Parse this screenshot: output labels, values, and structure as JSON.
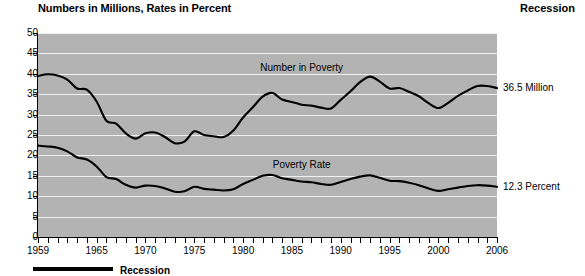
{
  "header": {
    "title": "Numbers in Millions, Rates in Percent",
    "recession_legend_label": "Recession"
  },
  "caption": {
    "text": "Recession"
  },
  "chart_data": {
    "type": "line",
    "title": "Numbers in Millions, Rates in Percent",
    "xlabel": "",
    "ylabel": "",
    "xlim": [
      1959,
      2006
    ],
    "ylim": [
      0,
      50
    ],
    "grid": true,
    "legend_position": "inline-annotation",
    "plot_background_color": "#b3b3b3",
    "gridline_color": "#f0f0f0",
    "line_color": "#000000",
    "y_ticks": [
      0,
      5,
      10,
      15,
      20,
      25,
      30,
      35,
      40,
      45,
      50
    ],
    "x_tick_labels": [
      "1959",
      "1965",
      "1970",
      "1975",
      "1980",
      "1985",
      "1990",
      "1995",
      "2000",
      "2006"
    ],
    "x_tick_label_years": [
      1959,
      1965,
      1970,
      1975,
      1980,
      1985,
      1990,
      1995,
      2000,
      2006
    ],
    "x": [
      1959,
      1960,
      1961,
      1962,
      1963,
      1964,
      1965,
      1966,
      1967,
      1968,
      1969,
      1970,
      1971,
      1972,
      1973,
      1974,
      1975,
      1976,
      1977,
      1978,
      1979,
      1980,
      1981,
      1982,
      1983,
      1984,
      1985,
      1986,
      1987,
      1988,
      1989,
      1990,
      1991,
      1992,
      1993,
      1994,
      1995,
      1996,
      1997,
      1998,
      1999,
      2000,
      2001,
      2002,
      2003,
      2004,
      2005,
      2006
    ],
    "series": [
      {
        "name": "Number in Poverty",
        "units": "millions",
        "annotation_label": "Number in Poverty",
        "end_label": "36.5 Million",
        "end_value": 36.5,
        "values": [
          39.5,
          39.9,
          39.6,
          38.6,
          36.4,
          36.1,
          33.2,
          28.5,
          27.8,
          25.4,
          24.1,
          25.4,
          25.6,
          24.5,
          23.0,
          23.4,
          25.9,
          25.0,
          24.7,
          24.5,
          26.1,
          29.3,
          31.8,
          34.4,
          35.3,
          33.7,
          33.1,
          32.4,
          32.2,
          31.7,
          31.5,
          33.6,
          35.7,
          38.0,
          39.3,
          38.1,
          36.4,
          36.5,
          35.6,
          34.5,
          32.8,
          31.6,
          32.9,
          34.6,
          35.9,
          37.0,
          37.0,
          36.5
        ]
      },
      {
        "name": "Poverty Rate",
        "units": "percent",
        "annotation_label": "Poverty Rate",
        "end_label": "12.3 Percent",
        "end_value": 12.3,
        "values": [
          22.4,
          22.2,
          21.9,
          21.0,
          19.5,
          19.0,
          17.3,
          14.7,
          14.2,
          12.8,
          12.1,
          12.6,
          12.5,
          11.9,
          11.1,
          11.2,
          12.3,
          11.8,
          11.6,
          11.4,
          11.7,
          13.0,
          14.0,
          15.0,
          15.2,
          14.4,
          14.0,
          13.6,
          13.4,
          13.0,
          12.8,
          13.5,
          14.2,
          14.8,
          15.1,
          14.5,
          13.8,
          13.7,
          13.3,
          12.7,
          11.9,
          11.3,
          11.7,
          12.1,
          12.5,
          12.7,
          12.6,
          12.3
        ]
      }
    ]
  }
}
